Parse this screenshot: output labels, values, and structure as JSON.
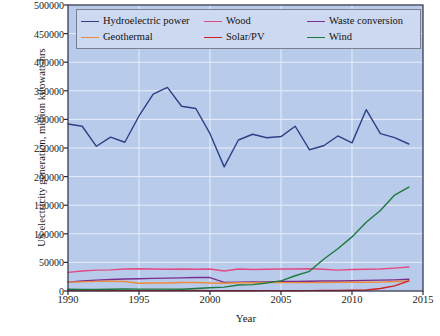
{
  "chart_data": {
    "type": "line",
    "title": "",
    "xlabel": "Year",
    "ylabel": "US electricity generation, million kilowatt-hrs",
    "xlim": [
      1990,
      2015
    ],
    "ylim": [
      0,
      500000
    ],
    "xticks": [
      1990,
      1995,
      2000,
      2005,
      2010,
      2015
    ],
    "yticks": [
      0,
      50000,
      100000,
      150000,
      200000,
      250000,
      300000,
      350000,
      400000,
      450000,
      500000
    ],
    "grid": true,
    "legend_position": "upper-center",
    "plot_bgcolor": "#b9cbeb",
    "grid_color": "#e8eefb",
    "axis_color": "#2b2b45",
    "x": [
      1990,
      1991,
      1992,
      1993,
      1994,
      1995,
      1996,
      1997,
      1998,
      1999,
      2000,
      2001,
      2002,
      2003,
      2004,
      2005,
      2006,
      2007,
      2008,
      2009,
      2010,
      2011,
      2012,
      2013,
      2014
    ],
    "series": [
      {
        "name": "Hydroelectric power",
        "color": "#2e3f86",
        "values": [
          292000,
          288000,
          253000,
          269000,
          260000,
          306000,
          344000,
          356000,
          323000,
          319000,
          275000,
          217000,
          264000,
          274000,
          268000,
          270000,
          288000,
          247000,
          254000,
          271000,
          259000,
          317000,
          275000,
          268000,
          257000
        ]
      },
      {
        "name": "Wood",
        "color": "#e24a84",
        "values": [
          32500,
          35000,
          36500,
          37000,
          38500,
          39000,
          38500,
          38000,
          38500,
          38000,
          38500,
          35000,
          38500,
          37500,
          38000,
          38500,
          38500,
          39000,
          38000,
          36500,
          37500,
          38000,
          38500,
          40000,
          42000
        ]
      },
      {
        "name": "Waste conversion",
        "color": "#7b2d8e",
        "values": [
          15500,
          17500,
          19000,
          20000,
          21000,
          21500,
          22000,
          22500,
          23000,
          23500,
          23500,
          15000,
          15500,
          16000,
          16000,
          16500,
          16500,
          17000,
          17500,
          17500,
          18000,
          18500,
          19000,
          19500,
          20500
        ]
      },
      {
        "name": "Geothermal",
        "color": "#ef8b3c",
        "values": [
          15500,
          16000,
          16800,
          17000,
          16500,
          13500,
          14000,
          14000,
          14800,
          14800,
          14000,
          13500,
          14400,
          14400,
          14800,
          14700,
          14600,
          14600,
          14800,
          15000,
          15200,
          15300,
          15600,
          16500,
          17000
        ]
      },
      {
        "name": "Solar/PV",
        "color": "#cf2020",
        "values": [
          800,
          800,
          800,
          900,
          800,
          800,
          800,
          900,
          900,
          900,
          500,
          500,
          550,
          530,
          575,
          550,
          510,
          610,
          860,
          890,
          1200,
          1800,
          4300,
          9000,
          17700
        ]
      },
      {
        "name": "Wind",
        "color": "#1d7a3e",
        "values": [
          3000,
          2700,
          2900,
          3000,
          3500,
          3200,
          3300,
          3300,
          3000,
          4500,
          5600,
          6700,
          10400,
          11200,
          14100,
          17800,
          26600,
          34400,
          55400,
          73900,
          94600,
          120200,
          140800,
          167800,
          181700
        ]
      }
    ]
  },
  "axes": {
    "y_ticks": [
      "0",
      "50000",
      "100000",
      "150000",
      "200000",
      "250000",
      "300000",
      "350000",
      "400000",
      "450000",
      "500000"
    ],
    "x_ticks": [
      "1990",
      "1995",
      "2000",
      "2005",
      "2010",
      "2015"
    ],
    "y_title": "US electricity generation, million kilowatt-hrs",
    "x_title": "Year"
  },
  "legend": {
    "entries": [
      {
        "label": "Hydroelectric power",
        "color": "#2e3f86"
      },
      {
        "label": "Wood",
        "color": "#e24a84"
      },
      {
        "label": "Waste conversion",
        "color": "#7b2d8e"
      },
      {
        "label": "Geothermal",
        "color": "#ef8b3c"
      },
      {
        "label": "Solar/PV",
        "color": "#cf2020"
      },
      {
        "label": "Wind",
        "color": "#1d7a3e"
      }
    ]
  }
}
